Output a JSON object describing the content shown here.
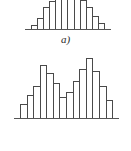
{
  "figure": {
    "background_color": "#ffffff",
    "bar_outline_color": "#4a4a4a",
    "bar_fill_color": "#ffffff",
    "axis_color": "#555555",
    "caption_color": "#2b2b2b"
  },
  "panels": [
    {
      "id": "panel-a",
      "caption": "a)",
      "shape": "symmetric unimodal (bell-shaped, flat plateau)"
    },
    {
      "id": "panel-d",
      "caption": "d)",
      "shape": "bimodal (two peaks with central dip)"
    }
  ],
  "chart_data": [
    {
      "type": "bar",
      "title": "a)",
      "xlabel": "",
      "ylabel": "",
      "categories": [
        "1",
        "2",
        "3",
        "4",
        "5",
        "6",
        "7",
        "8",
        "9",
        "10",
        "11",
        "12"
      ],
      "values": [
        4,
        11,
        22,
        28,
        30,
        30,
        30,
        30,
        29,
        22,
        13,
        6
      ],
      "ylim": [
        0,
        30
      ],
      "grid": false,
      "legend": false,
      "annotations": [
        "a)"
      ]
    },
    {
      "type": "bar",
      "title": "d)",
      "xlabel": "",
      "ylabel": "",
      "categories": [
        "1",
        "2",
        "3",
        "4",
        "5",
        "6",
        "7",
        "8",
        "9",
        "10",
        "11",
        "12",
        "13",
        "14"
      ],
      "values": [
        13,
        22,
        30,
        50,
        42,
        33,
        20,
        24,
        35,
        46,
        56,
        44,
        30,
        17
      ],
      "ylim": [
        0,
        60
      ],
      "grid": false,
      "legend": false,
      "annotations": [
        "d)"
      ]
    }
  ]
}
